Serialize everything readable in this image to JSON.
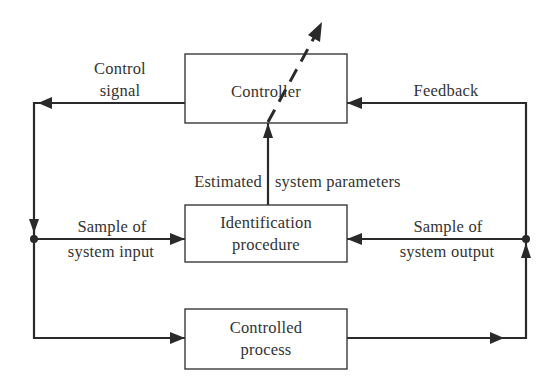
{
  "diagram": {
    "type": "adaptive-control-block-diagram",
    "blocks": {
      "controller": {
        "label": "Controller"
      },
      "identification": {
        "line1": "Identification",
        "line2": "procedure"
      },
      "process": {
        "line1": "Controlled",
        "line2": "process"
      }
    },
    "labels": {
      "control_signal": {
        "line1": "Control",
        "line2": "signal"
      },
      "feedback": "Feedback",
      "estimated_left": "Estimated",
      "estimated_right": "system parameters",
      "sample_input": {
        "line1": "Sample of",
        "line2": "system input"
      },
      "sample_output": {
        "line1": "Sample of",
        "line2": "system output"
      }
    },
    "colors": {
      "line": "#2a2a2a",
      "text": "#333333",
      "background": "#ffffff"
    }
  }
}
